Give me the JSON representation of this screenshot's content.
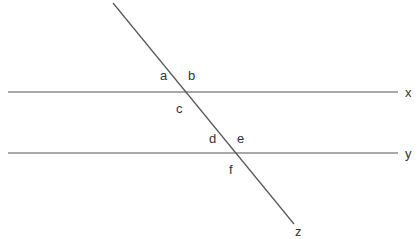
{
  "diagram": {
    "type": "parallel-lines-transversal",
    "line_color": "#555555",
    "label_color": "#333333",
    "lines": [
      {
        "name": "x",
        "x1": 8,
        "y1": 92,
        "x2": 398,
        "y2": 92,
        "label": "x",
        "lx": 405,
        "ly": 97
      },
      {
        "name": "y",
        "x1": 8,
        "y1": 153,
        "x2": 398,
        "y2": 153,
        "label": "y",
        "lx": 405,
        "ly": 158
      },
      {
        "name": "z",
        "x1": 113,
        "y1": 3,
        "x2": 294,
        "y2": 224,
        "label": "z",
        "lx": 295,
        "ly": 236
      }
    ],
    "angles": [
      {
        "label": "a",
        "x": 160,
        "y": 80
      },
      {
        "label": "b",
        "x": 188,
        "y": 80
      },
      {
        "label": "c",
        "x": 176,
        "y": 113
      },
      {
        "label": "d",
        "x": 209,
        "y": 143
      },
      {
        "label": "e",
        "x": 237,
        "y": 143
      },
      {
        "label": "f",
        "x": 229,
        "y": 174
      }
    ]
  }
}
